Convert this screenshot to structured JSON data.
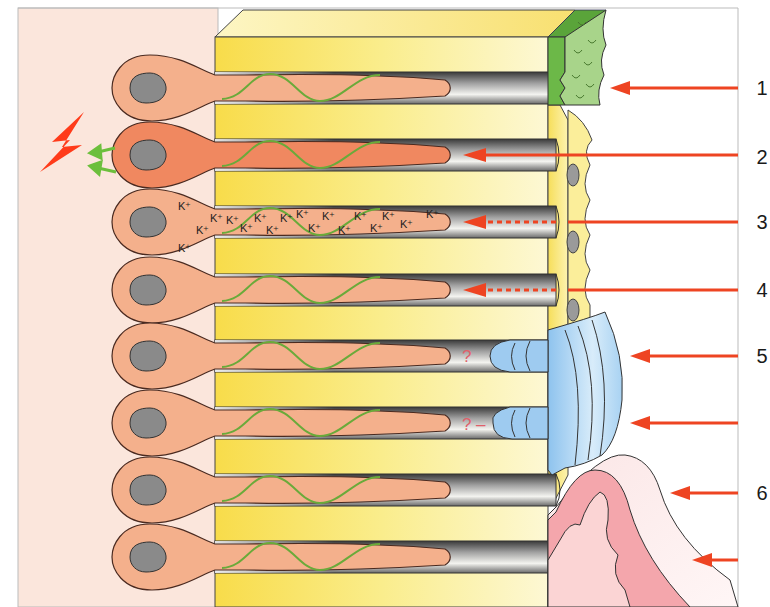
{
  "diagram": {
    "colors": {
      "background_pulp": "#fbe6dc",
      "dentin_yellow": "#f9e77a",
      "dentin_light": "#fdf6c8",
      "odontoblast": "#f4b08c",
      "odontoblast_stimulated": "#f08860",
      "nucleus": "#8a8a8a",
      "nerve_fiber": "#6aaa3a",
      "smear_layer_green": "#a8d48a",
      "smear_layer_dark": "#5aa43a",
      "resin_blue": "#9ecbf0",
      "gingiva_pink": "#f4a6ac",
      "gingiva_light": "#fbe2e2",
      "arrow_red": "#ee4422",
      "lightning_red": "#ff3b1a",
      "signal_green": "#6cbf3c",
      "question_mark": "#e0606a"
    },
    "rows": [
      {
        "id": 1,
        "y": 88,
        "state": "normal"
      },
      {
        "id": 2,
        "y": 155,
        "state": "stimulated"
      },
      {
        "id": 3,
        "y": 222,
        "state": "potassium"
      },
      {
        "id": 4,
        "y": 290,
        "state": "normal"
      },
      {
        "id": 5,
        "y": 356,
        "state": "normal"
      },
      {
        "id": 6,
        "y": 423,
        "state": "normal"
      },
      {
        "id": 7,
        "y": 490,
        "state": "normal"
      },
      {
        "id": 8,
        "y": 557,
        "state": "normal"
      }
    ],
    "labels": [
      {
        "text": "1",
        "y": 88
      },
      {
        "text": "2",
        "y": 157
      },
      {
        "text": "3",
        "y": 222
      },
      {
        "text": "4",
        "y": 290
      },
      {
        "text": "5",
        "y": 356
      },
      {
        "text": "6",
        "y": 493
      }
    ],
    "potassium_ion": "K⁺",
    "question_marks": [
      "?",
      "?"
    ],
    "dash": "–",
    "annotations": {
      "1": "Smear layer / occluding coating on surface",
      "2": "Stimulus transmitted through open tubule to nerve",
      "3": "Potassium ions depolarize nerve fibers (dashed)",
      "4": "Partially occluded tubule (dashed)",
      "5": "Resin / sealant plugs in tubules",
      "6": "Gingival tissue covering exposed dentin"
    }
  }
}
